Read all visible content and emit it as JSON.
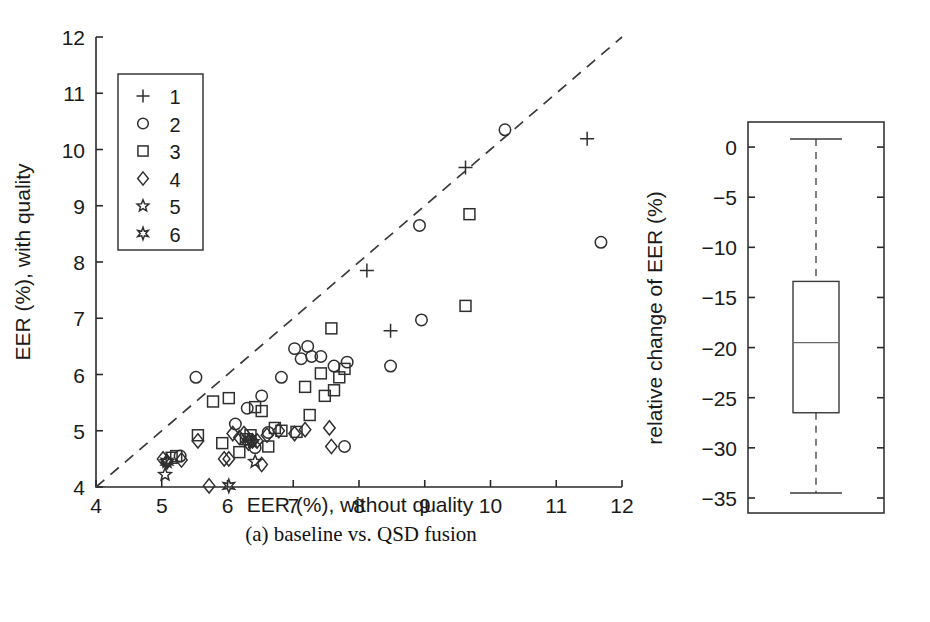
{
  "figure": {
    "panel_a_caption_prefix": "(a)",
    "panel_a_caption": "(a) baseline vs. QSD fusion",
    "panel_b_caption_line1": "(b) relative change of",
    "panel_b_caption_line2": "performance"
  },
  "chart_data": [
    {
      "type": "scatter",
      "id": "panel-a",
      "title": "",
      "xlabel": "EER (%), without quality",
      "ylabel": "EER (%), with quality",
      "xlim": [
        4,
        12
      ],
      "ylim": [
        4,
        12
      ],
      "xticks": [
        4,
        5,
        6,
        7,
        8,
        9,
        10,
        11,
        12
      ],
      "yticks": [
        4,
        5,
        6,
        7,
        8,
        9,
        10,
        11,
        12
      ],
      "xticklabels": [
        "4",
        "5",
        "6",
        "7",
        "8",
        "9",
        "10",
        "11",
        "12"
      ],
      "yticklabels": [
        "4",
        "5",
        "6",
        "7",
        "8",
        "9",
        "10",
        "11",
        "12"
      ],
      "grid": false,
      "reference_line": {
        "type": "identity",
        "style": "dashed",
        "from": [
          4,
          4
        ],
        "to": [
          12,
          12
        ]
      },
      "legend": {
        "position": "upper-left",
        "entries": [
          {
            "label": "1",
            "marker": "plus"
          },
          {
            "label": "2",
            "marker": "circle"
          },
          {
            "label": "3",
            "marker": "square"
          },
          {
            "label": "4",
            "marker": "diamond"
          },
          {
            "label": "5",
            "marker": "pentagram"
          },
          {
            "label": "6",
            "marker": "hexagram"
          }
        ]
      },
      "series": [
        {
          "name": "1",
          "marker": "plus",
          "points": [
            [
              8.12,
              7.85
            ],
            [
              8.48,
              6.78
            ],
            [
              9.62,
              9.68
            ],
            [
              11.47,
              10.19
            ]
          ]
        },
        {
          "name": "2",
          "marker": "circle",
          "points": [
            [
              5.28,
              4.55
            ],
            [
              5.52,
              5.95
            ],
            [
              6.12,
              5.12
            ],
            [
              6.3,
              5.4
            ],
            [
              6.42,
              4.7
            ],
            [
              6.52,
              5.62
            ],
            [
              6.62,
              4.97
            ],
            [
              6.82,
              5.95
            ],
            [
              7.02,
              6.46
            ],
            [
              7.12,
              6.28
            ],
            [
              7.22,
              6.5
            ],
            [
              7.28,
              6.32
            ],
            [
              7.42,
              6.32
            ],
            [
              7.62,
              6.15
            ],
            [
              7.78,
              4.72
            ],
            [
              7.82,
              6.22
            ],
            [
              8.48,
              6.15
            ],
            [
              8.92,
              8.65
            ],
            [
              8.95,
              6.97
            ],
            [
              10.22,
              10.35
            ],
            [
              11.68,
              8.35
            ]
          ]
        },
        {
          "name": "3",
          "marker": "square",
          "points": [
            [
              5.15,
              4.52
            ],
            [
              5.22,
              4.55
            ],
            [
              5.55,
              4.92
            ],
            [
              5.78,
              5.52
            ],
            [
              5.92,
              4.78
            ],
            [
              6.02,
              5.58
            ],
            [
              6.18,
              4.62
            ],
            [
              6.28,
              4.85
            ],
            [
              6.35,
              4.92
            ],
            [
              6.42,
              5.42
            ],
            [
              6.52,
              5.35
            ],
            [
              6.62,
              4.72
            ],
            [
              6.72,
              5.05
            ],
            [
              6.82,
              5.0
            ],
            [
              7.05,
              4.98
            ],
            [
              7.18,
              5.78
            ],
            [
              7.25,
              5.28
            ],
            [
              7.42,
              6.02
            ],
            [
              7.48,
              5.62
            ],
            [
              7.58,
              6.82
            ],
            [
              7.62,
              5.72
            ],
            [
              7.7,
              5.95
            ],
            [
              7.78,
              6.1
            ],
            [
              9.62,
              7.22
            ],
            [
              9.68,
              8.85
            ]
          ]
        },
        {
          "name": "4",
          "marker": "diamond",
          "points": [
            [
              5.02,
              4.5
            ],
            [
              5.08,
              4.45
            ],
            [
              5.3,
              4.48
            ],
            [
              5.55,
              4.82
            ],
            [
              5.72,
              4.02
            ],
            [
              5.95,
              4.5
            ],
            [
              6.02,
              4.5
            ],
            [
              6.08,
              4.95
            ],
            [
              6.18,
              4.88
            ],
            [
              6.25,
              4.95
            ],
            [
              6.32,
              4.78
            ],
            [
              6.38,
              4.82
            ],
            [
              6.45,
              4.82
            ],
            [
              6.52,
              4.4
            ],
            [
              6.6,
              4.92
            ],
            [
              6.78,
              5.0
            ],
            [
              7.02,
              4.95
            ],
            [
              7.18,
              5.02
            ],
            [
              7.55,
              5.05
            ],
            [
              7.58,
              4.72
            ]
          ]
        },
        {
          "name": "5",
          "marker": "pentagram",
          "points": [
            [
              5.05,
              4.22
            ],
            [
              5.08,
              4.45
            ],
            [
              6.32,
              4.82
            ],
            [
              6.38,
              4.8
            ],
            [
              6.42,
              4.45
            ]
          ]
        },
        {
          "name": "6",
          "marker": "hexagram",
          "points": [
            [
              5.08,
              4.45
            ],
            [
              6.02,
              4.02
            ],
            [
              6.32,
              4.85
            ]
          ]
        }
      ]
    },
    {
      "type": "boxplot",
      "id": "panel-b",
      "title": "",
      "xlabel": "",
      "ylabel": "relative change of EER (%)",
      "ylim": [
        -36.5,
        2.5
      ],
      "yticks": [
        0,
        -5,
        -10,
        -15,
        -20,
        -25,
        -30,
        -35
      ],
      "yticklabels": [
        "0",
        "−5",
        "−10",
        "−15",
        "−20",
        "−25",
        "−30",
        "−35"
      ],
      "grid": false,
      "boxes": [
        {
          "name": "relative change of EER",
          "whisker_low": -34.5,
          "q1": -26.5,
          "median": -19.5,
          "q3": -13.4,
          "whisker_high": 0.8,
          "outliers": []
        }
      ]
    }
  ]
}
